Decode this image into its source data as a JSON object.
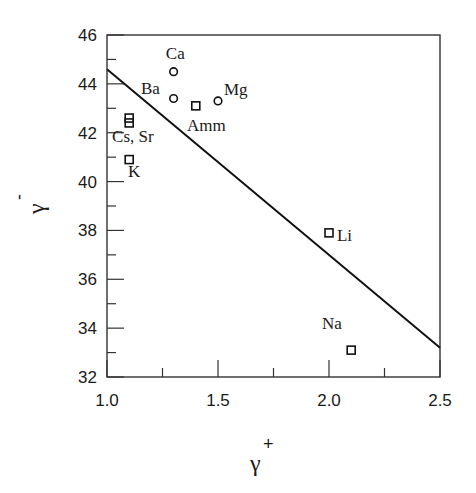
{
  "chart_data": {
    "type": "scatter",
    "title": "",
    "xlabel": "γ",
    "xlabel_superscript": "+",
    "ylabel": "γ",
    "ylabel_superscript": "-",
    "xlim": [
      1.0,
      2.5
    ],
    "ylim": [
      32,
      46
    ],
    "x_ticks": [
      1.0,
      1.5,
      2.0,
      2.5
    ],
    "x_tick_labels": [
      "1.0",
      "1.5",
      "2.0",
      "2.5"
    ],
    "x_minor_ticks": [
      1.25,
      1.75,
      2.25
    ],
    "y_ticks": [
      32,
      34,
      36,
      38,
      40,
      42,
      44,
      46
    ],
    "y_tick_labels": [
      "32",
      "34",
      "36",
      "38",
      "40",
      "42",
      "44",
      "46"
    ],
    "y_minor_ticks": [
      33,
      35,
      37,
      39,
      41,
      43,
      45
    ],
    "grid": false,
    "legend": null,
    "series": [
      {
        "name": "circles",
        "marker": "circle",
        "points": [
          {
            "label": "Ca",
            "x": 1.3,
            "y": 44.5
          },
          {
            "label": "Ba",
            "x": 1.3,
            "y": 43.4
          },
          {
            "label": "Mg",
            "x": 1.5,
            "y": 43.3
          }
        ]
      },
      {
        "name": "squares",
        "marker": "square",
        "points": [
          {
            "label": "Amm",
            "x": 1.4,
            "y": 43.1
          },
          {
            "label": "Cs",
            "x": 1.1,
            "y": 42.6
          },
          {
            "label": "Sr",
            "x": 1.1,
            "y": 42.4
          },
          {
            "label": "K",
            "x": 1.1,
            "y": 40.9
          },
          {
            "label": "Li",
            "x": 2.0,
            "y": 37.9
          },
          {
            "label": "Na",
            "x": 2.1,
            "y": 33.1
          }
        ]
      },
      {
        "name": "fit line",
        "marker": "line",
        "points": [
          {
            "x": 1.0,
            "y": 44.6
          },
          {
            "x": 2.5,
            "y": 33.2
          }
        ]
      }
    ],
    "annotations": [
      {
        "text": "Ca",
        "x": 1.265,
        "y": 45.0
      },
      {
        "text": "Ba",
        "x": 1.153,
        "y": 43.6
      },
      {
        "text": "Mg",
        "x": 1.527,
        "y": 43.55
      },
      {
        "text": "Amm",
        "x": 1.36,
        "y": 42.05
      },
      {
        "text": "Cs, Sr",
        "x": 1.023,
        "y": 41.6
      },
      {
        "text": "K",
        "x": 1.095,
        "y": 40.17
      },
      {
        "text": "Li",
        "x": 2.036,
        "y": 37.55
      },
      {
        "text": "Na",
        "x": 1.968,
        "y": 33.95
      }
    ]
  }
}
